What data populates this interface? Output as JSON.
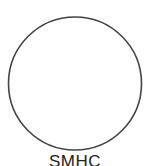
{
  "diagram": {
    "shape": "circle",
    "stroke_color": "#444444",
    "fill_color": "#ffffff",
    "label": "SMHC"
  }
}
